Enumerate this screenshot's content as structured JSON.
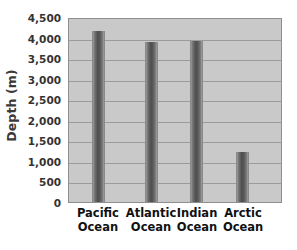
{
  "chart_data": {
    "type": "bar",
    "title": "",
    "xlabel": "",
    "ylabel": "Depth (m)",
    "categories": [
      "Pacific Ocean",
      "Atlantic Ocean",
      "Indian Ocean",
      "Arctic Ocean"
    ],
    "category_lines": [
      [
        "Pacific",
        "Ocean"
      ],
      [
        "Atlantic",
        "Ocean"
      ],
      [
        "Indian",
        "Ocean"
      ],
      [
        "Arctic",
        "Ocean"
      ]
    ],
    "values": [
      4160,
      3890,
      3915,
      1215
    ],
    "ylim": [
      0,
      4500
    ],
    "ytick_values": [
      0,
      500,
      1000,
      1500,
      2000,
      2500,
      3000,
      3500,
      4000,
      4500
    ],
    "ytick_labels": [
      "0",
      "500",
      "1,000",
      "1,500",
      "2,000",
      "2,500",
      "3,000",
      "3,500",
      "4,000",
      "4,500"
    ],
    "grid": true,
    "grid_axis": "y",
    "legend": false,
    "legend_position": "none",
    "series": [
      {
        "name": "Depth",
        "values": [
          4160,
          3890,
          3915,
          1215
        ]
      }
    ],
    "bar_centers_pct": [
      14.0,
      38.8,
      60.3,
      81.8
    ],
    "colors": {
      "plot_background": "#c9c9c9",
      "figure_background": "#ffffff",
      "bar_fill": "#5a5a5a",
      "gridline": "#9b9b9b",
      "axis_border": "#8f8f8f",
      "tick_label": "#333333",
      "axis_title": "#3a3a3a",
      "category_label": "#111111"
    }
  }
}
